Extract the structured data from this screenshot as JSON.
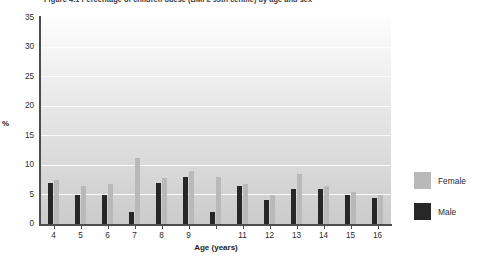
{
  "caption": "Figure 4.1  Percentage of children obese (BMI ≥ 95th centile) by age and sex",
  "legend": {
    "position": "right",
    "items": [
      {
        "label": "Female",
        "key": "female",
        "color": "#b9b9b9"
      },
      {
        "label": "Male",
        "key": "male",
        "color": "#272727"
      }
    ]
  },
  "chart_data": {
    "type": "bar",
    "title": "",
    "xlabel": "Age (years)",
    "ylabel": "%",
    "ylim": [
      0,
      35
    ],
    "yticks": [
      0,
      5,
      10,
      15,
      20,
      25,
      30,
      35
    ],
    "grid": true,
    "categories": [
      "4",
      "5",
      "6",
      "7",
      "8",
      "9",
      "10",
      "11",
      "12",
      "13",
      "14",
      "15",
      "16"
    ],
    "tick_labels": [
      "4",
      "5",
      "6",
      "7",
      "8",
      "9",
      "",
      "11",
      "12",
      "13",
      "14",
      "15",
      "16"
    ],
    "series": [
      {
        "name": "Male",
        "color": "#272727",
        "values": [
          7.0,
          5.0,
          5.0,
          2.0,
          7.0,
          8.0,
          2.0,
          6.5,
          4.0,
          6.0,
          6.0,
          5.0,
          4.5
        ]
      },
      {
        "name": "Female",
        "color": "#b9b9b9",
        "values": [
          7.5,
          6.5,
          6.8,
          11.3,
          7.8,
          9.0,
          8.0,
          6.8,
          5.0,
          8.5,
          6.5,
          5.5,
          5.0
        ]
      }
    ]
  }
}
